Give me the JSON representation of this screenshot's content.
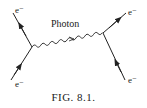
{
  "diagram": {
    "type": "feynman",
    "photon_label": "Photon",
    "particles": [
      {
        "id": "e-top-left",
        "label": "e⁻"
      },
      {
        "id": "e-bottom-left",
        "label": "e⁻"
      },
      {
        "id": "e-top-right",
        "label": "e⁻"
      },
      {
        "id": "e-bottom-right",
        "label": "e⁻"
      }
    ],
    "caption": "FIG. 8.1."
  }
}
